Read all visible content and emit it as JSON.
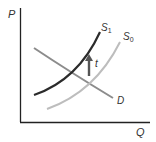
{
  "diagram": {
    "type": "supply-demand-tax-shift",
    "axes": {
      "y_label": "P",
      "x_label": "Q"
    },
    "curves": [
      {
        "id": "S1",
        "label": "S",
        "subscript": "1",
        "color": "#2b2b2b",
        "description": "supply after tax"
      },
      {
        "id": "S0",
        "label": "S",
        "subscript": "0",
        "color": "#b8b8b8",
        "description": "original supply"
      },
      {
        "id": "D",
        "label": "D",
        "subscript": "",
        "color": "#8c8c8c",
        "description": "demand"
      }
    ],
    "shift_arrow": {
      "label": "t",
      "direction": "up",
      "color": "#555555"
    }
  }
}
